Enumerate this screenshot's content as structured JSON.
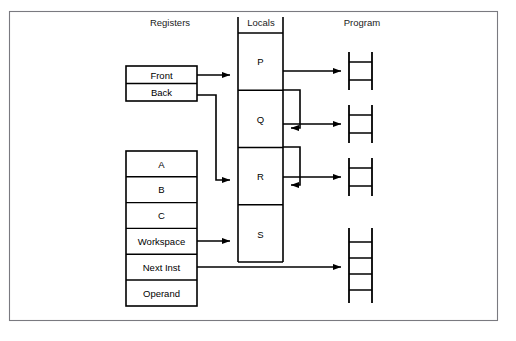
{
  "figure": {
    "background_color": "#ffffff",
    "line_color": "#000000",
    "frame_color": "#7a7a80"
  },
  "columns": {
    "headers": [
      {
        "id": "registers",
        "label": "Registers",
        "x": 170,
        "y": 26
      },
      {
        "id": "locals",
        "label": "Locals",
        "x": 261,
        "y": 26
      },
      {
        "id": "program",
        "label": "Program",
        "x": 362,
        "y": 26
      }
    ]
  },
  "registers": {
    "queue_box": {
      "name": "queue-registers",
      "x": 126,
      "y": 66,
      "w": 71,
      "h": 35,
      "cells": [
        {
          "id": "front",
          "label": "Front"
        },
        {
          "id": "back",
          "label": "Back"
        }
      ]
    },
    "stack_box": {
      "name": "stack-registers",
      "x": 126,
      "y": 151,
      "w": 71,
      "h": 155,
      "cells": [
        {
          "id": "a",
          "label": "A"
        },
        {
          "id": "b",
          "label": "B"
        },
        {
          "id": "c",
          "label": "C"
        },
        {
          "id": "workspace",
          "label": "Workspace"
        },
        {
          "id": "next_inst",
          "label": "Next Inst"
        },
        {
          "id": "operand",
          "label": "Operand"
        }
      ]
    }
  },
  "locals": {
    "box": {
      "name": "locals-column",
      "x": 238,
      "y": 24,
      "w": 45,
      "h": 238
    },
    "cells": [
      {
        "id": "p",
        "label": "P"
      },
      {
        "id": "q",
        "label": "Q"
      },
      {
        "id": "r",
        "label": "R"
      },
      {
        "id": "s",
        "label": "S"
      }
    ]
  },
  "program": {
    "ladders": [
      {
        "id": "ladder-p",
        "x": 349,
        "y": 52,
        "w": 23,
        "h": 38,
        "rungs": 2
      },
      {
        "id": "ladder-q",
        "x": 349,
        "y": 105,
        "w": 23,
        "h": 38,
        "rungs": 2
      },
      {
        "id": "ladder-r",
        "x": 349,
        "y": 158,
        "w": 23,
        "h": 38,
        "rungs": 2
      },
      {
        "id": "ladder-s",
        "x": 349,
        "y": 228,
        "w": 23,
        "h": 75,
        "rungs": 4
      }
    ]
  },
  "connections": [
    {
      "id": "front-to-p",
      "from": "Front",
      "to": "P",
      "kind": "arrow"
    },
    {
      "id": "back-to-r",
      "from": "Back",
      "to": "R",
      "kind": "arrow"
    },
    {
      "id": "workspace-to-s",
      "from": "Workspace",
      "to": "S",
      "kind": "arrow"
    },
    {
      "id": "next-inst-to-program",
      "from": "Next Inst",
      "to": "ladder-s",
      "kind": "arrow"
    },
    {
      "id": "p-to-ladder-p",
      "from": "P",
      "to": "ladder-p",
      "kind": "arrow"
    },
    {
      "id": "p-loop-to-q",
      "from": "P",
      "to": "Q",
      "kind": "loop-arrow"
    },
    {
      "id": "q-to-ladder-q",
      "from": "Q",
      "to": "ladder-q",
      "kind": "arrow"
    },
    {
      "id": "q-loop-to-r",
      "from": "Q",
      "to": "R",
      "kind": "loop-arrow"
    },
    {
      "id": "r-to-ladder-r",
      "from": "R",
      "to": "ladder-r",
      "kind": "arrow"
    }
  ]
}
